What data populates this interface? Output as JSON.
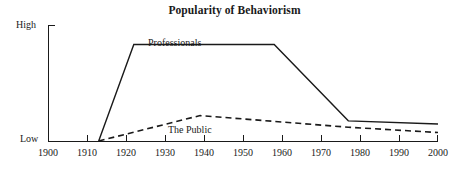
{
  "chart_data": {
    "type": "line",
    "title": "Popularity of Behaviorism",
    "xlabel": "",
    "ylabel": "",
    "xlim": [
      1900,
      2000
    ],
    "ylim": [
      0,
      100
    ],
    "grid": false,
    "legend": "inline-annotations",
    "x_ticks": [
      "1900",
      "1910",
      "1920",
      "1930",
      "1940",
      "1950",
      "1960",
      "1970",
      "1980",
      "1990",
      "2000"
    ],
    "y_ticks": [
      "Low",
      "High"
    ],
    "series": [
      {
        "name": "Professionals",
        "style": "solid",
        "color": "#1a1a1a",
        "points": [
          {
            "x": 1913,
            "y": 0
          },
          {
            "x": 1922,
            "y": 91
          },
          {
            "x": 1958,
            "y": 91
          },
          {
            "x": 1977,
            "y": 19
          },
          {
            "x": 2000,
            "y": 16
          }
        ]
      },
      {
        "name": "The Public",
        "style": "dashed",
        "color": "#1a1a1a",
        "points": [
          {
            "x": 1913,
            "y": 0
          },
          {
            "x": 1939,
            "y": 24
          },
          {
            "x": 1977,
            "y": 13
          },
          {
            "x": 2000,
            "y": 8
          }
        ]
      }
    ],
    "annotations": [
      {
        "text": "Professionals",
        "x": 1926,
        "y": 82
      },
      {
        "text": "The Public",
        "x": 1931,
        "y": 6
      }
    ]
  },
  "axes": {
    "y_high_label": "High",
    "y_low_label": "Low"
  }
}
